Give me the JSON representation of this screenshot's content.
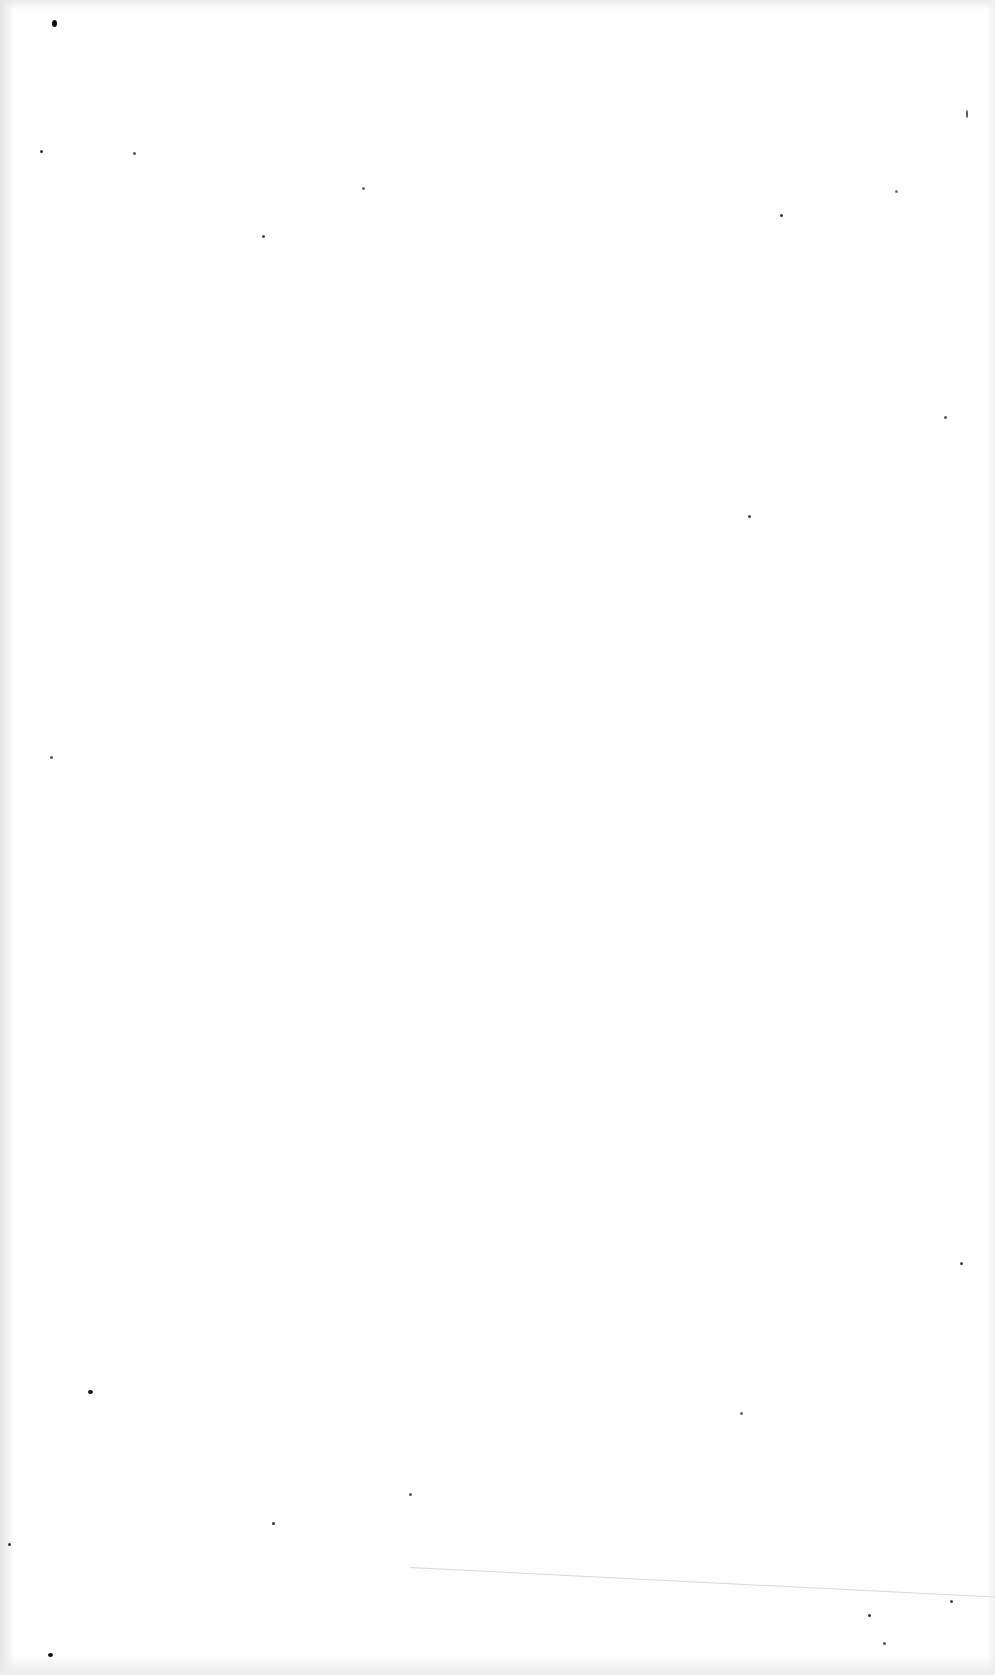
{
  "document": {
    "type": "scanned-blank-page",
    "background_color": "#fefefe",
    "text_content": ""
  },
  "specks": [
    {
      "x": 52,
      "y": 20,
      "w": 5,
      "h": 7,
      "color": "#111111"
    },
    {
      "x": 40,
      "y": 150,
      "w": 3,
      "h": 3,
      "color": "#333333"
    },
    {
      "x": 133,
      "y": 152,
      "w": 3,
      "h": 3,
      "color": "#555555"
    },
    {
      "x": 262,
      "y": 235,
      "w": 3,
      "h": 3,
      "color": "#444444"
    },
    {
      "x": 362,
      "y": 187,
      "w": 3,
      "h": 3,
      "color": "#666666"
    },
    {
      "x": 780,
      "y": 214,
      "w": 3,
      "h": 3,
      "color": "#333333"
    },
    {
      "x": 895,
      "y": 190,
      "w": 3,
      "h": 3,
      "color": "#777777"
    },
    {
      "x": 944,
      "y": 416,
      "w": 3,
      "h": 3,
      "color": "#555555"
    },
    {
      "x": 748,
      "y": 515,
      "w": 3,
      "h": 3,
      "color": "#444444"
    },
    {
      "x": 966,
      "y": 110,
      "w": 2,
      "h": 8,
      "color": "#555555"
    },
    {
      "x": 50,
      "y": 756,
      "w": 3,
      "h": 3,
      "color": "#555555"
    },
    {
      "x": 88,
      "y": 1390,
      "w": 5,
      "h": 4,
      "color": "#111111"
    },
    {
      "x": 272,
      "y": 1522,
      "w": 3,
      "h": 3,
      "color": "#333333"
    },
    {
      "x": 409,
      "y": 1493,
      "w": 3,
      "h": 3,
      "color": "#555555"
    },
    {
      "x": 960,
      "y": 1262,
      "w": 3,
      "h": 3,
      "color": "#444444"
    },
    {
      "x": 48,
      "y": 1653,
      "w": 5,
      "h": 4,
      "color": "#111111"
    },
    {
      "x": 868,
      "y": 1614,
      "w": 3,
      "h": 3,
      "color": "#333333"
    },
    {
      "x": 950,
      "y": 1600,
      "w": 3,
      "h": 3,
      "color": "#444444"
    },
    {
      "x": 8,
      "y": 1543,
      "w": 3,
      "h": 3,
      "color": "#333333"
    },
    {
      "x": 883,
      "y": 1642,
      "w": 3,
      "h": 3,
      "color": "#555555"
    },
    {
      "x": 740,
      "y": 1412,
      "w": 3,
      "h": 3,
      "color": "#666666"
    }
  ]
}
